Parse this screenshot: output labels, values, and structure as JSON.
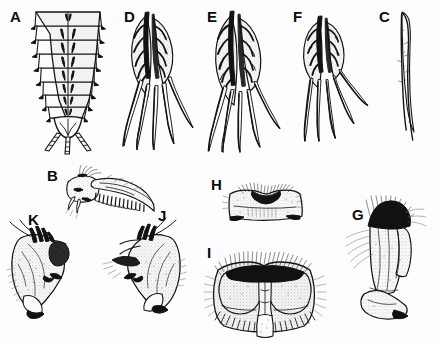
{
  "plate": {
    "title": "Taxonomic illustration plate of aquatic insect larval and adult structures",
    "background_color": "#fdfdfd",
    "ink_color": "#141414",
    "width": 440,
    "height": 342,
    "style": "pen-and-ink stipple line drawing",
    "panel_count": 11
  },
  "panels": [
    {
      "id": "A",
      "label": "A",
      "label_x": 10,
      "label_y": 9,
      "subject": "larval abdomen, dorsal view with segments and terminal cerci",
      "segments": 9,
      "x": 28,
      "y": 8,
      "width": 88,
      "height": 142
    },
    {
      "id": "D",
      "label": "D",
      "label_x": 124,
      "label_y": 9,
      "subject": "abdominal gill with branched tracheation and long filaments",
      "filaments": 5,
      "x": 130,
      "y": 10,
      "width": 66,
      "height": 138
    },
    {
      "id": "E",
      "label": "E",
      "label_x": 207,
      "label_y": 9,
      "subject": "abdominal gill, broader lamella with dense tracheation",
      "filaments": 5,
      "x": 213,
      "y": 10,
      "width": 68,
      "height": 140
    },
    {
      "id": "F",
      "label": "F",
      "label_x": 293,
      "label_y": 9,
      "subject": "abdominal gill, reduced lamella with elongate filaments",
      "filaments": 5,
      "x": 300,
      "y": 10,
      "width": 62,
      "height": 135
    },
    {
      "id": "C",
      "label": "C",
      "label_x": 379,
      "label_y": 9,
      "subject": "slender filamentous gill, single undivided process",
      "filaments": 1,
      "x": 396,
      "y": 12,
      "width": 18,
      "height": 128
    },
    {
      "id": "B",
      "label": "B",
      "label_x": 47,
      "label_y": 168,
      "subject": "mandible in lateral view with pectinate inner margin and apical setae",
      "x": 66,
      "y": 172,
      "width": 96,
      "height": 48
    },
    {
      "id": "K",
      "label": "K",
      "label_x": 28,
      "label_y": 212,
      "subject": "genital forceps, left lateral view with dark apical sclerite",
      "x": 8,
      "y": 226,
      "width": 80,
      "height": 94
    },
    {
      "id": "J",
      "label": "J",
      "label_x": 158,
      "label_y": 208,
      "subject": "genital forceps, right lateral view with dark apical sclerite",
      "x": 100,
      "y": 224,
      "width": 82,
      "height": 92
    },
    {
      "id": "H",
      "label": "H",
      "label_x": 211,
      "label_y": 177,
      "subject": "subgenital plate, ventral view with emarginate posterior margin",
      "x": 226,
      "y": 184,
      "width": 78,
      "height": 40
    },
    {
      "id": "I",
      "label": "I",
      "label_x": 207,
      "label_y": 245,
      "subject": "paired genital lobes, ventral view with dense dark setal brushes",
      "x": 210,
      "y": 254,
      "width": 110,
      "height": 82
    },
    {
      "id": "G",
      "label": "G",
      "label_x": 352,
      "label_y": 207,
      "subject": "leg or appendage with dense dark setal tuft at base",
      "x": 344,
      "y": 200,
      "width": 88,
      "height": 128
    }
  ]
}
